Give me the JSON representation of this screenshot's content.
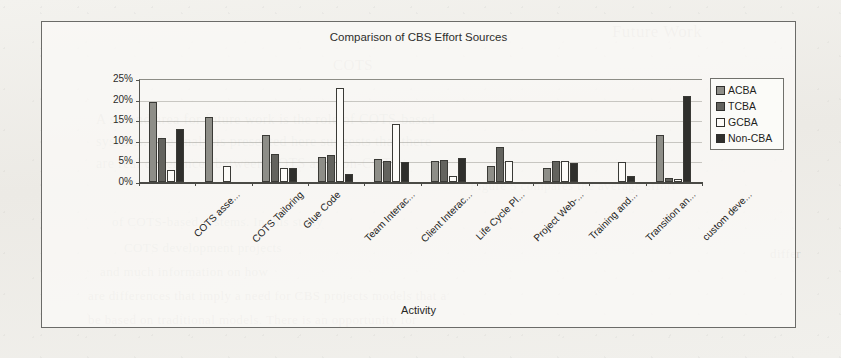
{
  "page": {
    "background_ghost_text": [
      {
        "text": "Future Work",
        "x": 612,
        "y": 22,
        "size": 17
      },
      {
        "text": "COTS",
        "x": 333,
        "y": 57,
        "size": 15
      },
      {
        "text": "A second area for future work is the role of COTS-based",
        "x": 96,
        "y": 112,
        "size": 14
      },
      {
        "text": "systems. The analysis presented here suggests that there",
        "x": 96,
        "y": 134,
        "size": 14
      },
      {
        "text": "are real differences between COTS and non-COTS",
        "x": 96,
        "y": 156,
        "size": 14
      },
      {
        "text": "Figure 5 compares the average effort",
        "x": 470,
        "y": 178,
        "size": 13
      },
      {
        "text": "of COTS-based systems. In this study",
        "x": 112,
        "y": 214,
        "size": 13
      },
      {
        "text": "COTS development projects",
        "x": 124,
        "y": 240,
        "size": 13
      },
      {
        "text": "and much information on how",
        "x": 100,
        "y": 264,
        "size": 13
      },
      {
        "text": "are differences that imply a need for CBS projects models that a",
        "x": 88,
        "y": 288,
        "size": 13
      },
      {
        "text": "be based on traditional models. There is an opportunity for",
        "x": 88,
        "y": 312,
        "size": 13
      },
      {
        "text": "differ",
        "x": 770,
        "y": 246,
        "size": 13
      }
    ]
  },
  "chart_data": {
    "type": "bar",
    "title": "Comparison of CBS Effort Sources",
    "xlabel": "Activity",
    "ylabel": "",
    "ylim": [
      0,
      25
    ],
    "ytick_labels": [
      "0%",
      "5%",
      "10%",
      "15%",
      "20%",
      "25%"
    ],
    "ytick_values": [
      0,
      5,
      10,
      15,
      20,
      25
    ],
    "grid": true,
    "legend_position": "right",
    "categories": [
      "COTS asse...",
      "COTS Tailoring",
      "Glue Code",
      "Team Interac...",
      "Client Interac...",
      "Life Cycle Pl...",
      "Project Web-...",
      "Training and...",
      "Transition an...",
      "custom deve..."
    ],
    "series": [
      {
        "name": "ACBA",
        "color": "#8e8e88",
        "values": [
          19.5,
          15.8,
          11.5,
          6.0,
          5.5,
          5.2,
          4.0,
          3.5,
          0.0,
          11.5
        ]
      },
      {
        "name": "TCBA",
        "color": "#63635e",
        "values": [
          10.8,
          0.0,
          6.8,
          6.5,
          5.0,
          5.3,
          8.5,
          5.0,
          0.0,
          1.0
        ]
      },
      {
        "name": "GCBA",
        "color": "#fcfbf8",
        "values": [
          2.8,
          4.0,
          3.3,
          22.8,
          14.0,
          1.5,
          5.0,
          5.0,
          4.8,
          0.8
        ]
      },
      {
        "name": "Non-CBA",
        "color": "#2f2f2c",
        "values": [
          12.8,
          0.0,
          3.3,
          2.0,
          4.8,
          5.8,
          0.0,
          4.5,
          1.5,
          20.8
        ]
      }
    ]
  }
}
